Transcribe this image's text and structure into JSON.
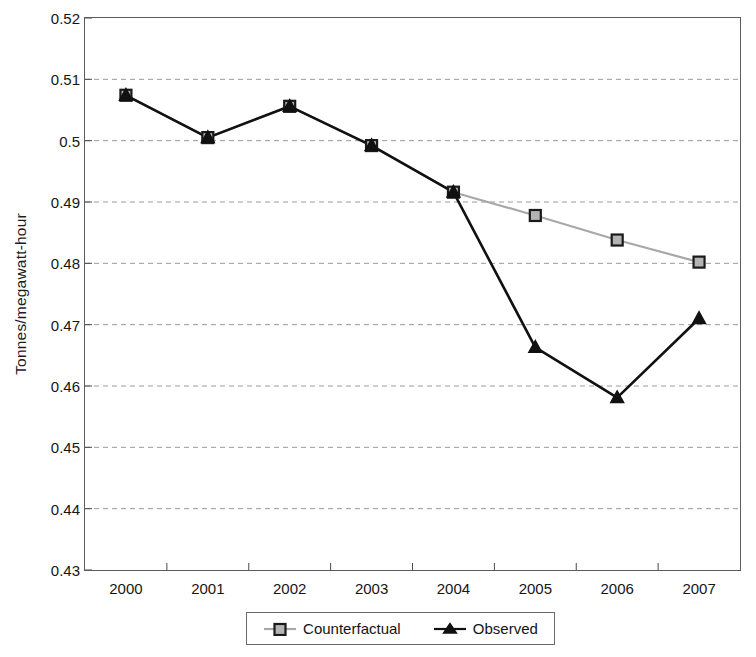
{
  "chart_data": {
    "type": "line",
    "title": "",
    "xlabel": "",
    "ylabel": "Tonnes/megawatt-hour",
    "categories": [
      "2000",
      "2001",
      "2002",
      "2003",
      "2004",
      "2005",
      "2006",
      "2007"
    ],
    "ylim": [
      0.43,
      0.52
    ],
    "yticks": [
      "0.43",
      "0.44",
      "0.45",
      "0.46",
      "0.47",
      "0.48",
      "0.49",
      "0.5",
      "0.51",
      "0.52"
    ],
    "ytick_values": [
      0.43,
      0.44,
      0.45,
      0.46,
      0.47,
      0.48,
      0.49,
      0.5,
      0.51,
      0.52
    ],
    "grid": "horizontal-dashed",
    "legend_position": "bottom",
    "series": [
      {
        "name": "Counterfactual",
        "color": "#a8a8a8",
        "marker": "square",
        "marker_fill": "#b4b4b4",
        "marker_edge": "#1a1a1a",
        "values": [
          0.5074,
          0.5005,
          0.5056,
          0.4992,
          0.4916,
          0.4878,
          0.4838,
          0.4802
        ]
      },
      {
        "name": "Observed",
        "color": "#111111",
        "marker": "triangle",
        "marker_fill": "#111111",
        "marker_edge": "#111111",
        "values": [
          0.5074,
          0.5005,
          0.5056,
          0.4992,
          0.4916,
          0.4663,
          0.4581,
          0.471
        ]
      }
    ]
  },
  "legend": {
    "entries": [
      {
        "label": "Counterfactual"
      },
      {
        "label": "Observed"
      }
    ]
  }
}
